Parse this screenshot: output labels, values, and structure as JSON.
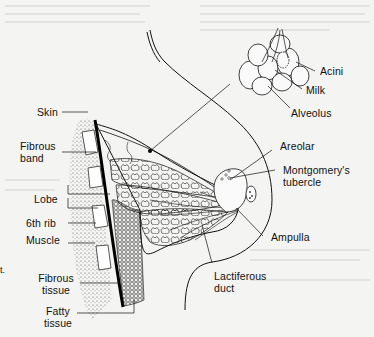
{
  "figure": {
    "type": "anatomical-diagram",
    "stray_text": "t."
  },
  "labels": {
    "inset": {
      "acini": "Acini",
      "milk": "Milk",
      "alveolus": "Alveolus"
    },
    "left": {
      "skin": "Skin",
      "fibrous_band_1": "Fibrous",
      "fibrous_band_2": "band",
      "lobe": "Lobe",
      "sixth_rib": "6th rib",
      "muscle": "Muscle",
      "fibrous_tissue_1": "Fibrous",
      "fibrous_tissue_2": "tissue",
      "fatty_tissue_1": "Fatty",
      "fatty_tissue_2": "tissue"
    },
    "right": {
      "areolar": "Areolar",
      "montgomery_1": "Montgomery's",
      "montgomery_2": "tubercle",
      "ampulla": "Ampulla",
      "lactiferous_1": "Lactiferous",
      "lactiferous_2": "duct"
    }
  },
  "colors": {
    "ink": "#111111",
    "paper": "#f4f4f2",
    "stipple": "#8a8a8a"
  }
}
